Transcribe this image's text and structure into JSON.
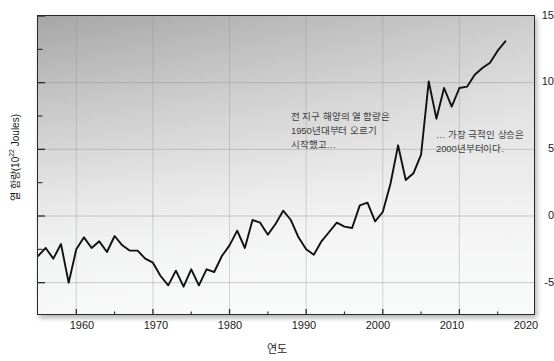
{
  "axes": {
    "y_title_text": "열 함량(10",
    "y_title_exponent": "22",
    "y_title_tail": " Joules)",
    "x_title": "연도",
    "y_ticks": [
      "15",
      "10",
      "5",
      "0",
      "-5"
    ],
    "x_ticks": [
      "1960",
      "1970",
      "1980",
      "1990",
      "2000",
      "2010",
      "2020"
    ]
  },
  "annotations": {
    "early": "전 지구 해양의 열 함량은\n1950년대부터 오르기\n시작했고…",
    "recent": "… 가장 극적인 상승은\n2000년부터이다."
  },
  "style": {
    "line_color": "#111111",
    "frame_color": "#2b2b2b",
    "grid_color": "#8e9294",
    "text_color": "#1a1a1a",
    "annotation_color": "#3c3c3c"
  },
  "chart_data": {
    "type": "line",
    "title": "",
    "xlabel": "연도",
    "ylabel": "열 함량(10^22 Joules)",
    "xlim": [
      1955,
      2020
    ],
    "ylim": [
      -7.5,
      15
    ],
    "yticks": [
      -5,
      0,
      5,
      10,
      15
    ],
    "yticks_minor": [
      -2.5,
      2.5,
      7.5,
      12.5
    ],
    "xticks": [
      1960,
      1970,
      1980,
      1990,
      2000,
      2010,
      2020
    ],
    "xticks_minor": [
      1965,
      1975,
      1985,
      1995,
      2005,
      2015
    ],
    "grid": true,
    "legend": null,
    "series": [
      {
        "name": "전 지구 해양 열 함량",
        "units": "10^22 Joules",
        "x": [
          1955,
          1956,
          1957,
          1958,
          1959,
          1960,
          1961,
          1962,
          1963,
          1964,
          1965,
          1966,
          1967,
          1968,
          1969,
          1970,
          1971,
          1972,
          1973,
          1974,
          1975,
          1976,
          1977,
          1978,
          1979,
          1980,
          1981,
          1982,
          1983,
          1984,
          1985,
          1986,
          1987,
          1988,
          1989,
          1990,
          1991,
          1992,
          1993,
          1994,
          1995,
          1996,
          1997,
          1998,
          1999,
          2000,
          2001,
          2002,
          2003,
          2004,
          2005,
          2006,
          2007,
          2008,
          2009,
          2010,
          2011,
          2012,
          2013,
          2014,
          2015,
          2016
        ],
        "y": [
          -3.0,
          -2.4,
          -3.2,
          -2.1,
          -5.0,
          -2.5,
          -1.6,
          -2.4,
          -1.9,
          -2.7,
          -1.5,
          -2.2,
          -2.6,
          -2.6,
          -3.2,
          -3.5,
          -4.5,
          -5.2,
          -4.1,
          -5.3,
          -4.0,
          -5.2,
          -4.0,
          -4.2,
          -3.0,
          -2.2,
          -1.1,
          -2.4,
          -0.3,
          -0.5,
          -1.4,
          -0.6,
          0.4,
          -0.3,
          -1.6,
          -2.5,
          -2.9,
          -1.9,
          -1.2,
          -0.5,
          -0.8,
          -0.9,
          0.8,
          1.0,
          -0.4,
          0.3,
          2.4,
          5.3,
          2.7,
          3.2,
          4.6,
          10.1,
          7.3,
          9.6,
          8.2,
          9.6,
          9.7,
          10.6,
          11.1,
          11.5,
          12.4,
          13.1
        ]
      }
    ],
    "annotations": [
      {
        "text": "전 지구 해양의 열 함량은 1950년대부터 오르기 시작했고…",
        "x": 1984,
        "y": 6.0
      },
      {
        "text": "… 가장 극적인 상승은 2000년부터이다.",
        "x": 2003,
        "y": 4.5
      }
    ]
  }
}
